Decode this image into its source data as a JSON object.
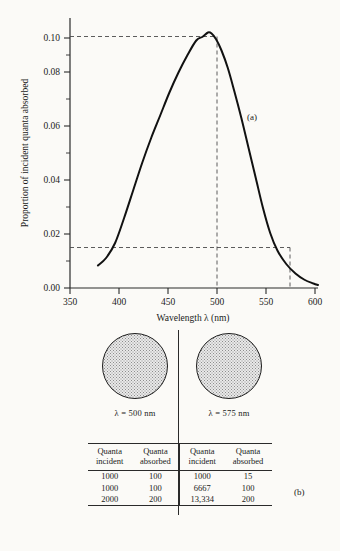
{
  "figure": {
    "panel_a_letter": "(a)",
    "panel_b_letter": "(b)"
  },
  "chart_data": {
    "type": "line",
    "title": "",
    "xlabel": "Wavelength λ (nm)",
    "ylabel": "Proportion of incident quanta absorbed",
    "xlim": [
      350,
      625
    ],
    "ylim": [
      0.0,
      0.108
    ],
    "xticks": [
      350,
      400,
      450,
      500,
      550,
      600
    ],
    "xtick_labels": [
      "350",
      "400",
      "450",
      "500",
      "550",
      "600"
    ],
    "yticks": [
      0.0,
      0.02,
      0.04,
      0.06,
      0.08,
      0.1
    ],
    "ytick_labels": [
      "0.00",
      "0.02",
      "0.04",
      "0.06",
      "0.08",
      "0.10"
    ],
    "yminorticks": [
      0.01,
      0.03,
      0.05,
      0.07,
      0.09
    ],
    "grid": false,
    "legend": "none",
    "series": [
      {
        "name": "Absorption spectrum",
        "x": [
          381,
          390,
          400,
          410,
          420,
          430,
          440,
          450,
          460,
          470,
          480,
          490,
          497,
          503,
          507,
          512,
          518,
          525,
          532,
          540,
          548,
          556,
          564,
          572,
          580,
          590,
          600,
          610,
          620,
          625
        ],
        "values": [
          0.009,
          0.012,
          0.018,
          0.028,
          0.039,
          0.05,
          0.06,
          0.069,
          0.078,
          0.086,
          0.093,
          0.099,
          0.1005,
          0.1022,
          0.1018,
          0.0995,
          0.095,
          0.088,
          0.079,
          0.068,
          0.056,
          0.044,
          0.032,
          0.022,
          0.015,
          0.0095,
          0.0058,
          0.0033,
          0.0018,
          0.0012
        ]
      }
    ],
    "annotations": [
      {
        "kind": "hline",
        "y": 0.1005,
        "x_from": 350,
        "x_to": 500,
        "style": "dashed"
      },
      {
        "kind": "vline",
        "x": 500,
        "y_from": 0.0,
        "y_to": 0.1005,
        "style": "dashed"
      },
      {
        "kind": "hline",
        "y": 0.015,
        "x_from": 350,
        "x_to": 575,
        "style": "dashed"
      },
      {
        "kind": "vline",
        "x": 575,
        "y_from": 0.0,
        "y_to": 0.015,
        "style": "dashed"
      }
    ],
    "readings": [
      {
        "wavelength_nm": 500,
        "proportion_absorbed": 0.1
      },
      {
        "wavelength_nm": 575,
        "proportion_absorbed": 0.015
      }
    ]
  },
  "lower_panel": {
    "beams": [
      {
        "id": "left",
        "label": "λ = 500  nm"
      },
      {
        "id": "right",
        "label": "λ = 575 nm"
      }
    ],
    "table": {
      "headers": [
        {
          "line1": "Quanta",
          "line2": "incident"
        },
        {
          "line1": "Quanta",
          "line2": "absorbed"
        },
        {
          "line1": "Quanta",
          "line2": "incident"
        },
        {
          "line1": "Quanta",
          "line2": "absorbed"
        }
      ],
      "rows": [
        [
          "1000",
          "100",
          "1000",
          "15"
        ],
        [
          "1000",
          "100",
          "6667",
          "100"
        ],
        [
          "2000",
          "200",
          "13,334",
          "200"
        ]
      ]
    }
  }
}
